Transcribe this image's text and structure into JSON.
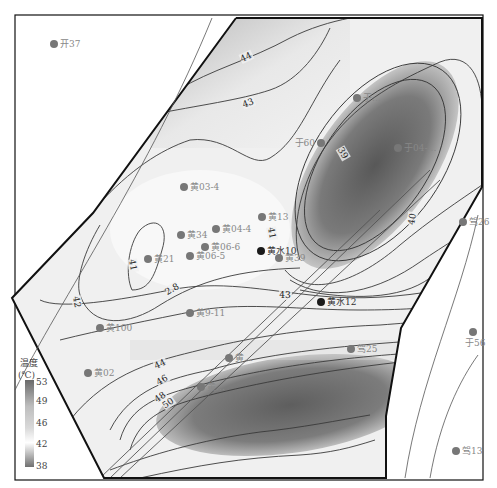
{
  "map": {
    "title": "Temperature contour map",
    "legend": {
      "title_line1": "温度",
      "title_line2": "(℃)",
      "ticks": [
        "53",
        "49",
        "46",
        "42",
        "38"
      ],
      "min": 38,
      "max": 53
    },
    "contour_labels": [
      {
        "text": "44",
        "x": 246,
        "y": 60,
        "rot": -25
      },
      {
        "text": "43",
        "x": 248,
        "y": 106,
        "rot": -20
      },
      {
        "text": "39",
        "x": 343,
        "y": 156,
        "rot": 60
      },
      {
        "text": "40",
        "x": 412,
        "y": 222,
        "rot": -80
      },
      {
        "text": "41",
        "x": 272,
        "y": 236,
        "rot": 80
      },
      {
        "text": "41",
        "x": 133,
        "y": 268,
        "rot": 80
      },
      {
        "text": "2.8",
        "x": 172,
        "y": 292,
        "rot": -30
      },
      {
        "text": "42",
        "x": 77,
        "y": 305,
        "rot": 80
      },
      {
        "text": "43",
        "x": 285,
        "y": 298,
        "rot": 0
      },
      {
        "text": "44",
        "x": 160,
        "y": 367,
        "rot": -25
      },
      {
        "text": "46",
        "x": 162,
        "y": 383,
        "rot": -30
      },
      {
        "text": "48",
        "x": 160,
        "y": 400,
        "rot": -35
      },
      {
        "text": "50",
        "x": 168,
        "y": 406,
        "rot": -35
      }
    ],
    "wells": [
      {
        "name": "开37",
        "x": 54,
        "y": 44,
        "dark": false
      },
      {
        "name": "于…",
        "x": 357,
        "y": 98,
        "dark": false
      },
      {
        "name": "于60",
        "x": 321,
        "y": 143,
        "dark": false,
        "label_left": true
      },
      {
        "name": "于04-…",
        "x": 398,
        "y": 148,
        "dark": false
      },
      {
        "name": "黄03-4",
        "x": 184,
        "y": 187,
        "dark": false
      },
      {
        "name": "黄13",
        "x": 262,
        "y": 217,
        "dark": false
      },
      {
        "name": "驾26",
        "x": 463,
        "y": 222,
        "dark": false
      },
      {
        "name": "黄34",
        "x": 181,
        "y": 235,
        "dark": false
      },
      {
        "name": "黄04-4",
        "x": 216,
        "y": 229,
        "dark": false
      },
      {
        "name": "黄06-6",
        "x": 205,
        "y": 247,
        "dark": false
      },
      {
        "name": "黄21",
        "x": 148,
        "y": 259,
        "dark": false
      },
      {
        "name": "黄06-5",
        "x": 190,
        "y": 256,
        "dark": false
      },
      {
        "name": "黄水10",
        "x": 261,
        "y": 251,
        "dark": true
      },
      {
        "name": "黄39",
        "x": 279,
        "y": 258,
        "dark": false
      },
      {
        "name": "黄水12",
        "x": 321,
        "y": 302,
        "dark": true
      },
      {
        "name": "黄9-11",
        "x": 190,
        "y": 313,
        "dark": false
      },
      {
        "name": "黄100",
        "x": 100,
        "y": 328,
        "dark": false
      },
      {
        "name": "于56",
        "x": 473,
        "y": 332,
        "dark": false,
        "label_below": true
      },
      {
        "name": "驾25",
        "x": 351,
        "y": 349,
        "dark": false
      },
      {
        "name": "黄…",
        "x": 229,
        "y": 358,
        "dark": false
      },
      {
        "name": "黄02",
        "x": 88,
        "y": 373,
        "dark": false
      },
      {
        "name": "黄…",
        "x": 201,
        "y": 387,
        "dark": false
      },
      {
        "name": "驾13",
        "x": 456,
        "y": 451,
        "dark": false
      }
    ],
    "colors": {
      "frame": "#111111",
      "contour": "#3a3a3a",
      "well": "#777777",
      "well_dark": "#1a1a1a",
      "low": "#6e6e6e",
      "high": "#ffffff"
    }
  }
}
